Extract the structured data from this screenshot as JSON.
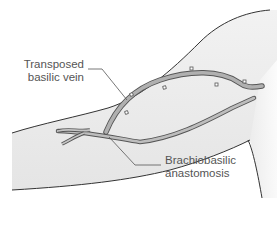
{
  "figure": {
    "labels": {
      "transposed_line1": "Transposed",
      "transposed_line2": "basilic vein",
      "anastomosis_line1": "Brachiobasilic",
      "anastomosis_line2": "anastomosis"
    },
    "colors": {
      "skin_fill": "#ececec",
      "skin_outline": "#333333",
      "vessel_fill": "#b8b8b8",
      "vessel_outline": "#555555",
      "leader_line": "#555555",
      "label_text": "#555555"
    }
  }
}
